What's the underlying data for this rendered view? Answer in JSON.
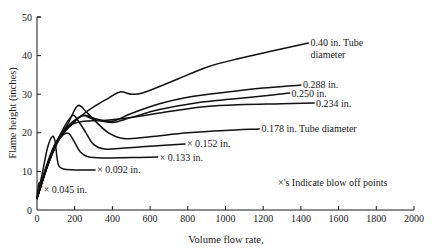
{
  "chart_data": {
    "type": "line",
    "title": "",
    "xlabel": "Volume flow rate,",
    "ylabel": "Flame height (inches)",
    "xlim": [
      0,
      2000
    ],
    "ylim": [
      0,
      50
    ],
    "x_ticks": [
      0,
      200,
      400,
      600,
      800,
      1000,
      1200,
      1400,
      1600,
      1800,
      2000
    ],
    "y_ticks": [
      0,
      10,
      20,
      30,
      40,
      50
    ],
    "grid": false,
    "legend": "none (inline curve labels)",
    "annotations": [
      "×'s Indicate blow off points"
    ],
    "series": [
      {
        "name": "0.40 in. Tube diameter",
        "label": "0.40 in. Tube",
        "label2": "diameter",
        "blow_off": false,
        "points": [
          [
            0,
            3
          ],
          [
            60,
            12
          ],
          [
            120,
            19
          ],
          [
            180,
            22
          ],
          [
            250,
            25
          ],
          [
            320,
            27.3
          ],
          [
            380,
            29
          ],
          [
            440,
            30.6
          ],
          [
            500,
            30
          ],
          [
            560,
            30.3
          ],
          [
            650,
            32
          ],
          [
            750,
            34
          ],
          [
            900,
            37
          ],
          [
            1050,
            39
          ],
          [
            1200,
            40.7
          ],
          [
            1350,
            42.3
          ],
          [
            1440,
            43.3
          ]
        ]
      },
      {
        "name": "0.288 in.",
        "label": "0.288 in.",
        "blow_off": false,
        "points": [
          [
            0,
            3
          ],
          [
            60,
            12
          ],
          [
            120,
            19
          ],
          [
            180,
            22.5
          ],
          [
            250,
            24.5
          ],
          [
            320,
            23.5
          ],
          [
            400,
            23
          ],
          [
            500,
            25
          ],
          [
            650,
            27.5
          ],
          [
            800,
            29.2
          ],
          [
            1000,
            30.5
          ],
          [
            1200,
            31.6
          ],
          [
            1400,
            32.4
          ]
        ]
      },
      {
        "name": "0.250 in.",
        "label": "0.250 in.",
        "blow_off": false,
        "points": [
          [
            0,
            3
          ],
          [
            60,
            12
          ],
          [
            120,
            18.5
          ],
          [
            180,
            22
          ],
          [
            240,
            24.5
          ],
          [
            300,
            23.5
          ],
          [
            400,
            22.7
          ],
          [
            500,
            24
          ],
          [
            650,
            26
          ],
          [
            850,
            27.8
          ],
          [
            1050,
            28.8
          ],
          [
            1250,
            29.8
          ],
          [
            1340,
            30.3
          ]
        ]
      },
      {
        "name": "0.234 in.",
        "label": "0.234 in.",
        "blow_off": false,
        "points": [
          [
            0,
            3
          ],
          [
            60,
            12
          ],
          [
            120,
            18.5
          ],
          [
            180,
            22
          ],
          [
            250,
            23
          ],
          [
            350,
            23.2
          ],
          [
            500,
            24
          ],
          [
            700,
            25.5
          ],
          [
            900,
            26.8
          ],
          [
            1100,
            27.3
          ],
          [
            1300,
            27.5
          ],
          [
            1470,
            27.7
          ]
        ]
      },
      {
        "name": "0.178 in. Tube diameter",
        "label": "0.178 in. Tube diameter",
        "blow_off": false,
        "points": [
          [
            0,
            3
          ],
          [
            50,
            11
          ],
          [
            100,
            17.5
          ],
          [
            160,
            22
          ],
          [
            215,
            27
          ],
          [
            260,
            25.5
          ],
          [
            320,
            22.5
          ],
          [
            380,
            20
          ],
          [
            460,
            18.5
          ],
          [
            600,
            19
          ],
          [
            800,
            20
          ],
          [
            1000,
            20.6
          ],
          [
            1180,
            21
          ]
        ]
      },
      {
        "name": "0.152 in.",
        "label": "× 0.152 in.",
        "blow_off": true,
        "points": [
          [
            0,
            3
          ],
          [
            50,
            11
          ],
          [
            100,
            17
          ],
          [
            150,
            22
          ],
          [
            190,
            24.5
          ],
          [
            220,
            23
          ],
          [
            260,
            20
          ],
          [
            300,
            17
          ],
          [
            360,
            15.8
          ],
          [
            450,
            16
          ],
          [
            600,
            16.5
          ],
          [
            785,
            17.1
          ]
        ]
      },
      {
        "name": "0.133 in.",
        "label": "× 0.133 in.",
        "blow_off": true,
        "points": [
          [
            0,
            3
          ],
          [
            40,
            10
          ],
          [
            90,
            16.5
          ],
          [
            140,
            19.5
          ],
          [
            170,
            19.8
          ],
          [
            200,
            17.5
          ],
          [
            230,
            15
          ],
          [
            270,
            13.8
          ],
          [
            350,
            13.5
          ],
          [
            500,
            13.6
          ],
          [
            640,
            13.7
          ]
        ]
      },
      {
        "name": "0.092 in.",
        "label": "× 0.092 in.",
        "blow_off": true,
        "points": [
          [
            0,
            3
          ],
          [
            30,
            10
          ],
          [
            55,
            16
          ],
          [
            80,
            19
          ],
          [
            95,
            18
          ],
          [
            105,
            14
          ],
          [
            115,
            11.5
          ],
          [
            140,
            10.6
          ],
          [
            200,
            10.4
          ],
          [
            308,
            10.4
          ]
        ]
      },
      {
        "name": "0.045 in.",
        "label": "× 0.045 in.",
        "blow_off": true,
        "points": [
          [
            0,
            3
          ],
          [
            8,
            6.5
          ],
          [
            15,
            7
          ],
          [
            25,
            6
          ]
        ]
      }
    ]
  },
  "axes": {
    "x_label": "Volume flow rate,",
    "y_label": "Flame height (inches)",
    "x_tick_labels": [
      "0",
      "200",
      "400",
      "600",
      "800",
      "1000",
      "1200",
      "1400",
      "1600",
      "1800",
      "2000"
    ],
    "y_tick_labels": [
      "0",
      "10",
      "20",
      "30",
      "40",
      "50"
    ]
  },
  "annotation": "×'s Indicate blow off points"
}
